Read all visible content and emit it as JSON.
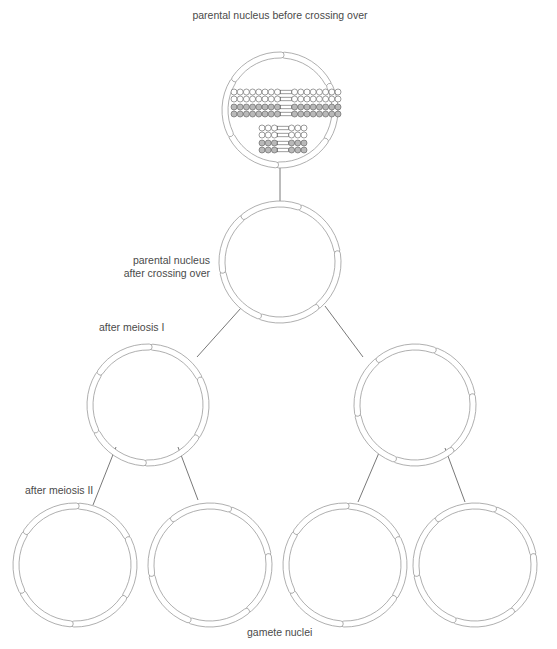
{
  "labels": {
    "top": "parental nucleus before crossing over",
    "after_crossing_line1": "parental nucleus",
    "after_crossing_line2": "after crossing over",
    "meiosis1": "after meiosis I",
    "meiosis2": "after meiosis II",
    "gametes": "gamete nuclei"
  },
  "colors": {
    "outline": "#9a9a9a",
    "line": "#555555",
    "bead_light": "#ffffff",
    "bead_dark": "#b9b9b9",
    "bead_stroke": "#5a5a5a"
  },
  "nuclei": [
    {
      "id": "parental-before",
      "cx": 280,
      "cy": 110,
      "r": 56
    },
    {
      "id": "parental-after",
      "cx": 280,
      "cy": 262,
      "r": 59
    },
    {
      "id": "meiosis1-left",
      "cx": 148,
      "cy": 405,
      "r": 59
    },
    {
      "id": "meiosis1-right",
      "cx": 415,
      "cy": 405,
      "r": 59
    },
    {
      "id": "gamete-1",
      "cx": 75,
      "cy": 565,
      "r": 60
    },
    {
      "id": "gamete-2",
      "cx": 210,
      "cy": 565,
      "r": 60
    },
    {
      "id": "gamete-3",
      "cx": 345,
      "cy": 565,
      "r": 60
    },
    {
      "id": "gamete-4",
      "cx": 475,
      "cy": 565,
      "r": 60
    }
  ],
  "chromosomes": {
    "long": [
      {
        "shade": "light",
        "y": 92
      },
      {
        "shade": "light",
        "y": 99
      },
      {
        "shade": "dark",
        "y": 107
      },
      {
        "shade": "dark",
        "y": 114
      }
    ],
    "short": [
      {
        "shade": "light",
        "y": 128
      },
      {
        "shade": "light",
        "y": 135
      },
      {
        "shade": "dark",
        "y": 143
      },
      {
        "shade": "dark",
        "y": 150
      }
    ],
    "long_beads_each_arm": 8,
    "short_beads_each_arm": 3
  }
}
